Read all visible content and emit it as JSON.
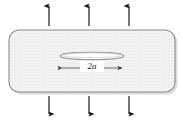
{
  "figure": {
    "name": "center-cracked-plate-under-remote-tension",
    "background_color": "#ffffff"
  },
  "plate": {
    "label": "plate-body",
    "fill_color": "#f2f2f2",
    "pattern": "stipple-dot-hatch",
    "pattern_dot_color": "#d9d9d9",
    "border_color": "#8c8c8c",
    "shadow_color": "#b3b3b3",
    "corner_radius": 10,
    "x": 9,
    "y": 30,
    "width": 166,
    "height": 62
  },
  "crack": {
    "label": "elliptical-crack",
    "shape": "flat-ellipse",
    "outline_color": "#8c8c8c",
    "fill_color": "#ffffff",
    "center_x": 92,
    "center_y": 56,
    "semi_major_axis": 32,
    "semi_minor_axis": 3.5
  },
  "dimension": {
    "label": "crack-length-dimension",
    "text": "2a",
    "line_color": "#4d4d4d",
    "y": 68,
    "x_start": 62,
    "x_end": 122
  },
  "load": {
    "arrow_color": "#1a1a1a",
    "top": {
      "label": "remote-tension-arrows-top",
      "direction": "up",
      "count": 3,
      "x_positions": [
        49,
        89,
        129
      ],
      "y_tail": 26,
      "y_head": 4
    },
    "bottom": {
      "label": "remote-tension-arrows-bottom",
      "direction": "down",
      "count": 3,
      "x_positions": [
        49,
        89,
        129
      ],
      "y_tail": 96,
      "y_head": 116
    }
  }
}
